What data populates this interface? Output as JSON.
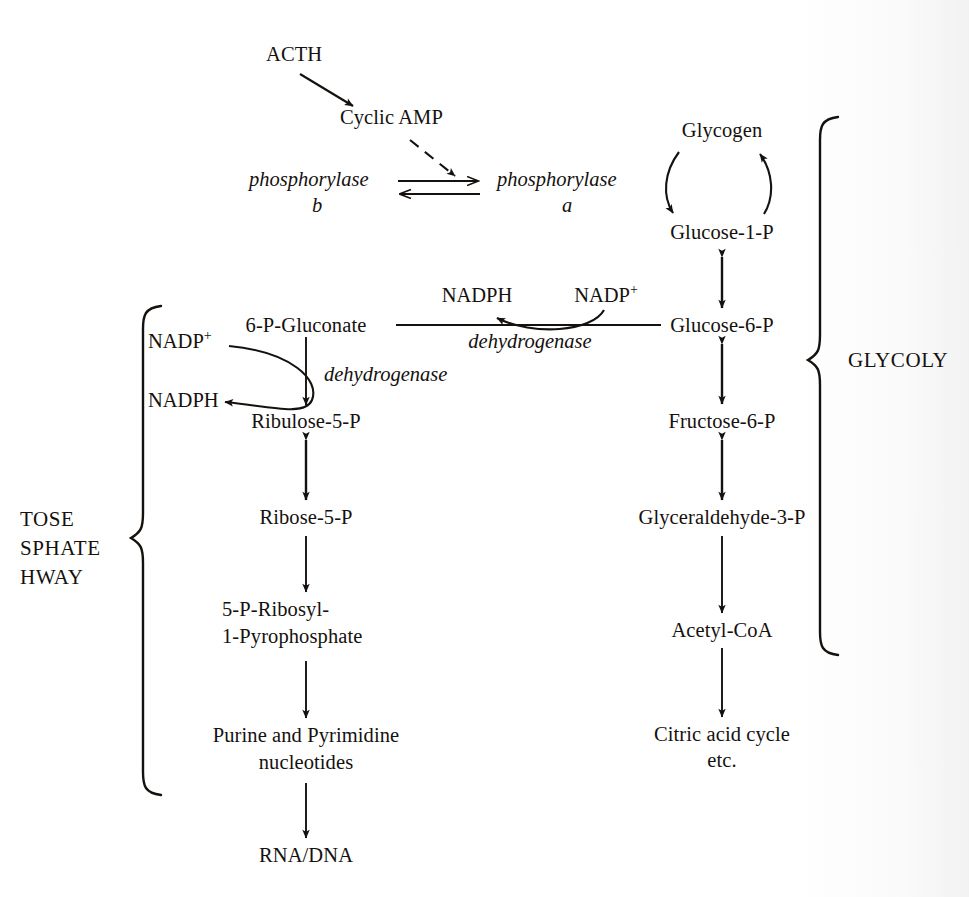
{
  "figure": {
    "type": "biochemical-pathway-diagram",
    "background_color": "#fdfdfd",
    "ink_color": "#15110f"
  },
  "hormone_cascade": {
    "acth": "ACTH",
    "cyclic_amp": "Cyclic AMP",
    "phosphorylase_b": "phosphorylase",
    "phosphorylase_b_sub": "b",
    "phosphorylase_a": "phosphorylase",
    "phosphorylase_a_sub": "a"
  },
  "glycolysis": {
    "bracket_label": "GLYCOLY",
    "nodes": [
      {
        "id": "glycogen",
        "label": "Glycogen"
      },
      {
        "id": "glucose-1-p",
        "label": "Glucose-1-P"
      },
      {
        "id": "glucose-6-p",
        "label": "Glucose-6-P"
      },
      {
        "id": "fructose-6-p",
        "label": "Fructose-6-P"
      },
      {
        "id": "glyceraldehyde-3-p",
        "label": "Glyceraldehyde-3-P"
      },
      {
        "id": "acetyl-coa",
        "label": "Acetyl-CoA"
      },
      {
        "id": "citric-acid-cycle-line1",
        "label": "Citric acid cycle"
      },
      {
        "id": "citric-acid-cycle-line2",
        "label": "etc."
      }
    ]
  },
  "pentose_phosphate": {
    "bracket_label_line1": "TOSE",
    "bracket_label_line2": "SPHATE",
    "bracket_label_line3": "HWAY",
    "nodes": [
      {
        "id": "6-p-gluconate",
        "label": "6-P-Gluconate"
      },
      {
        "id": "ribulose-5-p",
        "label": "Ribulose-5-P"
      },
      {
        "id": "ribose-5-p",
        "label": "Ribose-5-P"
      },
      {
        "id": "prpp-line1",
        "label": "5-P-Ribosyl-"
      },
      {
        "id": "prpp-line2",
        "label": "1-Pyrophosphate"
      },
      {
        "id": "nucleotides-line1",
        "label": "Purine and Pyrimidine"
      },
      {
        "id": "nucleotides-line2",
        "label": "nucleotides"
      },
      {
        "id": "rna-dna",
        "label": "RNA/DNA"
      }
    ]
  },
  "cofactors": {
    "g6pd_nadp_plus": "NADP",
    "g6pd_nadp_plus_charge": "+",
    "g6pd_nadph": "NADPH",
    "pgd_nadp_plus": "NADP",
    "pgd_nadp_plus_charge": "+",
    "pgd_nadph": "NADPH"
  },
  "enzymes": {
    "g6p_dehydrogenase": "dehydrogenase",
    "gluconate_dehydrogenase": "dehydrogenase"
  }
}
